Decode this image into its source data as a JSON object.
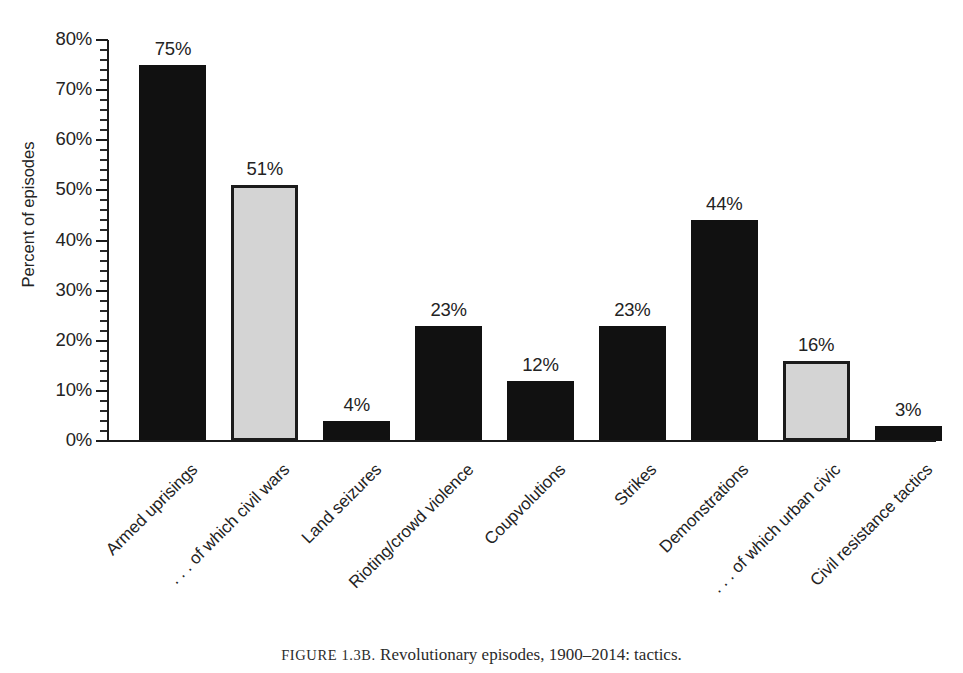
{
  "caption": {
    "prefix": "FIGURE 1.3B.",
    "text": " Revolutionary episodes, 1900–2014: tactics."
  },
  "axes": {
    "ylabel": "Percent of episodes",
    "ytick_labels": [
      "0%",
      "10%",
      "20%",
      "30%",
      "40%",
      "50%",
      "60%",
      "70%",
      "80%"
    ],
    "ymin": 0,
    "ymax": 80,
    "minor_tick_step": 2
  },
  "colors": {
    "bar_dark": "#111111",
    "bar_light": "#d4d4d4",
    "bar_light_border": "#1b1b1b",
    "axis": "#1b1b1b",
    "text": "#232323",
    "background": "#ffffff"
  },
  "chart_data": {
    "type": "bar",
    "title": "",
    "xlabel": "",
    "ylabel": "Percent of episodes",
    "ylim": [
      0,
      80
    ],
    "grid": false,
    "legend": "none",
    "categories": [
      "Armed uprisings",
      ". . . of which civil wars",
      "Land seizures",
      "Rioting/crowd violence",
      "Coupvolutions",
      "Strikes",
      "Demonstrations",
      ". . . of which urban civic",
      "Civil resistance tactics"
    ],
    "values": [
      75,
      51,
      4,
      23,
      12,
      23,
      44,
      16,
      3
    ],
    "value_labels": [
      "75%",
      "51%",
      "4%",
      "23%",
      "12%",
      "23%",
      "44%",
      "16%",
      "3%"
    ],
    "bar_styles": [
      "dark",
      "light",
      "dark",
      "dark",
      "dark",
      "dark",
      "dark",
      "light",
      "dark"
    ]
  }
}
